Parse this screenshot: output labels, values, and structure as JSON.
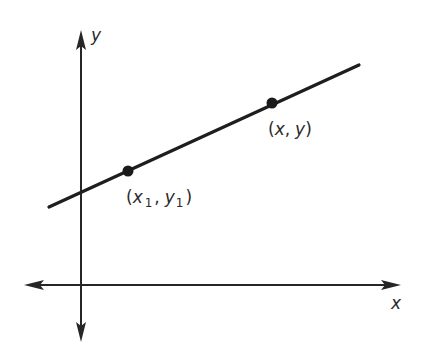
{
  "diagram": {
    "title": "",
    "axes": {
      "x_label": "x",
      "y_label": "y"
    },
    "line": {
      "description": "Straight line with positive slope passing through two points"
    },
    "points": [
      {
        "id": "p1",
        "label_open": "(",
        "x_var": "x",
        "x_sub": "1",
        "comma": ",",
        "y_var": "y",
        "y_sub": "1",
        "label_close": ")",
        "full_label": "(x1, y1)"
      },
      {
        "id": "p2",
        "label_open": "(",
        "x_var": "x",
        "comma": ",",
        "y_var": "y",
        "label_close": ")",
        "full_label": "(x, y)"
      }
    ],
    "colors": {
      "ink": "#262626",
      "background": "#ffffff"
    }
  }
}
